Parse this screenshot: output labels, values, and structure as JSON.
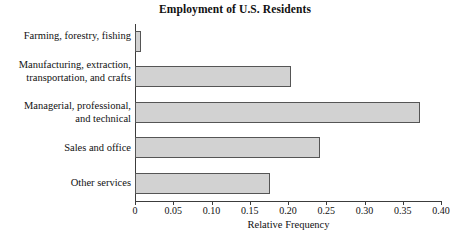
{
  "chart_data": {
    "type": "bar",
    "orientation": "horizontal",
    "title": "Employment of U.S. Residents",
    "xlabel": "Relative Frequency",
    "ylabel": "",
    "xlim": [
      0,
      0.4
    ],
    "grid": false,
    "legend": null,
    "xticks": [
      "0",
      "0.05",
      "0.10",
      "0.15",
      "0.20",
      "0.25",
      "0.30",
      "0.35",
      "0.40"
    ],
    "xtick_values": [
      0,
      0.05,
      0.1,
      0.15,
      0.2,
      0.25,
      0.3,
      0.35,
      0.4
    ],
    "categories": [
      "Farming, forestry, fishing",
      "Manufacturing, extraction,\ntransportation, and crafts",
      "Managerial, professional,\nand technical",
      "Sales and office",
      "Other services"
    ],
    "values": [
      0.008,
      0.204,
      0.372,
      0.242,
      0.176
    ],
    "bar_fill_color": "#d2d2d2",
    "bar_edge_color": "#555555",
    "axis_color": "#3c3c3c",
    "background_color": "#ffffff"
  }
}
